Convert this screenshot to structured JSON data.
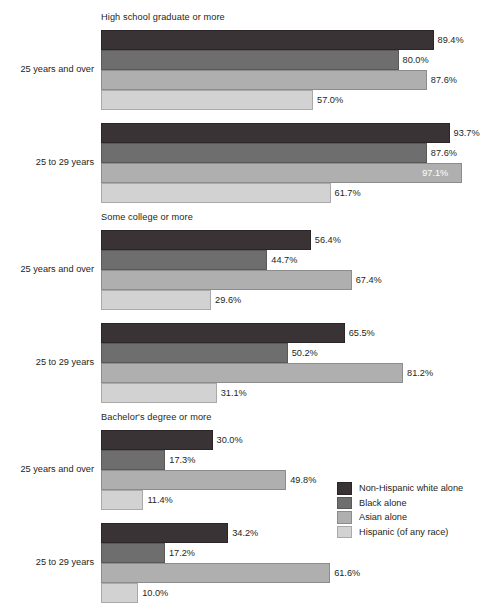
{
  "chart_data": {
    "type": "bar",
    "orientation": "horizontal",
    "title": "",
    "xlabel": "",
    "ylabel": "",
    "xlim": [
      0,
      100
    ],
    "grid": false,
    "legend_position": "right-middle",
    "value_suffix": "%",
    "series_names": [
      "Non-Hispanic white alone",
      "Black alone",
      "Asian alone",
      "Hispanic (of any race)"
    ],
    "series_colors": [
      "#3a3336",
      "#6f6e6e",
      "#b0afaf",
      "#d2d2d2"
    ],
    "sections": [
      {
        "title": "High school graduate or more",
        "groups": [
          {
            "category": "25 years and over",
            "values": [
              89.4,
              80.0,
              87.6,
              57.0
            ],
            "labels": [
              "89.4%",
              "80.0%",
              "87.6%",
              "57.0%"
            ],
            "label_inside": [
              false,
              false,
              false,
              false
            ]
          },
          {
            "category": "25 to 29 years",
            "values": [
              93.7,
              87.6,
              97.1,
              61.7
            ],
            "labels": [
              "93.7%",
              "87.6%",
              "97.1%",
              "61.7%"
            ],
            "label_inside": [
              false,
              false,
              true,
              false
            ]
          }
        ]
      },
      {
        "title": "Some college or more",
        "groups": [
          {
            "category": "25 years and over",
            "values": [
              56.4,
              44.7,
              67.4,
              29.6
            ],
            "labels": [
              "56.4%",
              "44.7%",
              "67.4%",
              "29.6%"
            ],
            "label_inside": [
              false,
              false,
              false,
              false
            ]
          },
          {
            "category": "25 to 29 years",
            "values": [
              65.5,
              50.2,
              81.2,
              31.1
            ],
            "labels": [
              "65.5%",
              "50.2%",
              "81.2%",
              "31.1%"
            ],
            "label_inside": [
              false,
              false,
              false,
              false
            ]
          }
        ]
      },
      {
        "title": "Bachelor's degree or more",
        "groups": [
          {
            "category": "25 years and over",
            "values": [
              30.0,
              17.3,
              49.8,
              11.4
            ],
            "labels": [
              "30.0%",
              "17.3%",
              "49.8%",
              "11.4%"
            ],
            "label_inside": [
              false,
              false,
              false,
              false
            ]
          },
          {
            "category": "25 to 29 years",
            "values": [
              34.2,
              17.2,
              61.6,
              10.0
            ],
            "labels": [
              "34.2%",
              "17.2%",
              "61.6%",
              "10.0%"
            ],
            "label_inside": [
              false,
              false,
              false,
              false
            ]
          }
        ]
      }
    ]
  },
  "legend": {
    "items": [
      {
        "label": "Non-Hispanic white alone",
        "color": "#3a3336"
      },
      {
        "label": "Black alone",
        "color": "#6f6e6e"
      },
      {
        "label": "Asian alone",
        "color": "#b0afaf"
      },
      {
        "label": "Hispanic (of any race)",
        "color": "#d2d2d2"
      }
    ]
  }
}
